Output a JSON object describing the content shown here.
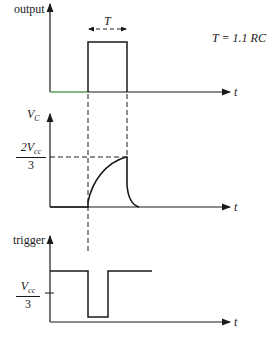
{
  "diagram": {
    "formula": "T = 1.1 RC",
    "panels": [
      {
        "id": "output",
        "y_label": "output",
        "x_label": "t",
        "interval_label": "T"
      },
      {
        "id": "vc",
        "y_label_main": "V",
        "y_label_sub": "C",
        "x_label": "t",
        "level_num_main": "2V",
        "level_num_sub": "cc",
        "level_den": "3"
      },
      {
        "id": "trigger",
        "y_label": "trigger",
        "x_label": "t",
        "level_num_main": "V",
        "level_num_sub": "cc",
        "level_den": "3"
      }
    ],
    "colors": {
      "ink": "#1a1a1a",
      "output_baseline": "#5aa05a",
      "background": "#ffffff"
    }
  }
}
